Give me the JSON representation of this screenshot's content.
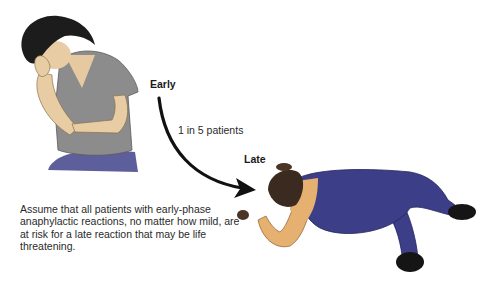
{
  "diagram": {
    "stages": {
      "early_label": "Early",
      "late_label": "Late"
    },
    "transition": {
      "label": "1 in 5 patients"
    },
    "note": "Assume that all patients with early-phase anaphylactic reactions, no matter how mild, are at risk for a late reaction that may be life threatening.",
    "figures": [
      {
        "name": "early-patient",
        "description": "seated woman holding her face"
      },
      {
        "name": "late-patient",
        "description": "collapsed man lying face-down"
      }
    ],
    "colors": {
      "arrow": "#111111",
      "shirt": "#8a8a8a",
      "hair": "#1c1c1c",
      "skin": "#e8cda4",
      "pants_early": "#5a5a9a",
      "overalls": "#3c3f88",
      "undershirt": "#e6b070",
      "shoes": "#151515"
    }
  }
}
